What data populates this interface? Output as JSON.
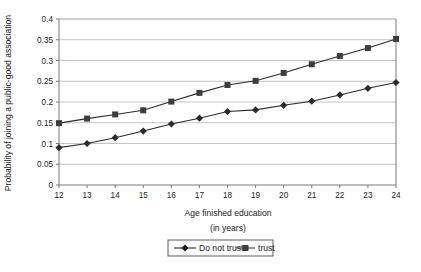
{
  "chart_data": {
    "type": "line",
    "title": "",
    "xlabel": "Age finished education",
    "xlabel_line2": "(in years)",
    "ylabel": "Probability of joining a public-good association",
    "x": [
      12,
      13,
      14,
      15,
      16,
      17,
      18,
      19,
      20,
      21,
      22,
      23,
      24
    ],
    "xlim": [
      12,
      24
    ],
    "ylim": [
      0,
      0.4
    ],
    "xticks": [
      "12",
      "13",
      "14",
      "15",
      "16",
      "17",
      "18",
      "19",
      "20",
      "21",
      "22",
      "23",
      "24"
    ],
    "yticks": [
      "0",
      "0.05",
      "0.1",
      "0.15",
      "0.2",
      "0.25",
      "0.3",
      "0.35",
      "0.4"
    ],
    "ytick_values": [
      0,
      0.05,
      0.1,
      0.15,
      0.2,
      0.25,
      0.3,
      0.35,
      0.4
    ],
    "grid": "horizontal",
    "legend_position": "bottom",
    "series": [
      {
        "name": "Do not trust",
        "marker": "diamond",
        "color": "#2b2b2b",
        "values": [
          0.09,
          0.1,
          0.114,
          0.13,
          0.147,
          0.161,
          0.177,
          0.181,
          0.192,
          0.202,
          0.217,
          0.233,
          0.247
        ]
      },
      {
        "name": "trust",
        "marker": "square",
        "color": "#3d3d3d",
        "values": [
          0.149,
          0.16,
          0.17,
          0.18,
          0.201,
          0.222,
          0.241,
          0.251,
          0.27,
          0.291,
          0.311,
          0.33,
          0.352
        ]
      }
    ]
  },
  "legend": {
    "item1": "Do not trust",
    "item2": "trust"
  },
  "colors": {
    "grid": "#b4b4b4",
    "axis": "#7a7a7a",
    "line_do_not_trust": "#2b2b2b",
    "line_trust": "#3d3d3d",
    "background": "#ffffff"
  }
}
